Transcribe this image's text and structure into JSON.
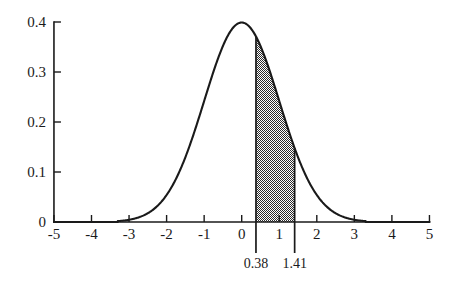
{
  "chart_data": {
    "type": "area",
    "title": "",
    "xlabel": "",
    "ylabel": "",
    "xlim": [
      -5,
      5
    ],
    "ylim": [
      0,
      0.4
    ],
    "grid": false,
    "legend": null,
    "curve": {
      "name": "standard normal density",
      "formula": "phi(x) = (1/sqrt(2*pi)) * exp(-x^2/2)",
      "mean": 0,
      "sd": 1,
      "peak_x": 0,
      "peak_y": 0.4,
      "visible_x_start": -3.3,
      "visible_x_end": 3.3
    },
    "shaded_region": {
      "label": "shaded area between 0.38 and 1.41",
      "x_start": 0.38,
      "x_end": 1.41,
      "y_at_x_start": 0.3704,
      "y_at_x_end": 0.1476,
      "fill": "#808080",
      "pattern": "checkerboard-dither"
    },
    "x_ticks": [
      {
        "value": -5,
        "label": "-5"
      },
      {
        "value": -4,
        "label": "-4"
      },
      {
        "value": -3,
        "label": "-3"
      },
      {
        "value": -2,
        "label": "-2"
      },
      {
        "value": -1,
        "label": "-1"
      },
      {
        "value": 0,
        "label": "0"
      },
      {
        "value": 1,
        "label": "1"
      },
      {
        "value": 2,
        "label": "2"
      },
      {
        "value": 3,
        "label": "3"
      },
      {
        "value": 4,
        "label": "4"
      },
      {
        "value": 5,
        "label": "5"
      }
    ],
    "y_ticks": [
      {
        "value": 0,
        "label": "0"
      },
      {
        "value": 0.1,
        "label": "0.1"
      },
      {
        "value": 0.2,
        "label": "0.2"
      },
      {
        "value": 0.3,
        "label": "0.3"
      },
      {
        "value": 0.4,
        "label": "0.4"
      }
    ],
    "boundary_markers": [
      {
        "value": 0.38,
        "label": "0.38"
      },
      {
        "value": 1.41,
        "label": "1.41"
      }
    ],
    "colors": {
      "ink": "#1a1a1a",
      "background": "#ffffff",
      "shading": "#808080"
    }
  }
}
